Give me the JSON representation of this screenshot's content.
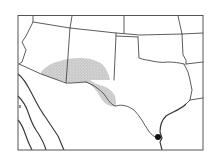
{
  "map": {
    "region": "Southwestern United States and northern Mexico",
    "range_layer": {
      "name": "range-shaded-area",
      "fill": "#c8c8c8",
      "pattern": "stipple"
    },
    "point_marker": {
      "name": "locality-dot",
      "color": "#111111"
    },
    "frame_color": "#555555",
    "line_color": "#4a4a4a"
  }
}
